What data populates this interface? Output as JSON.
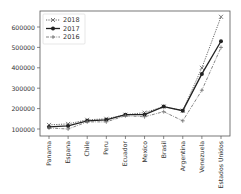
{
  "chart_data": {
    "type": "line",
    "title": "",
    "xlabel": "",
    "ylabel": "",
    "categories": [
      "Panama",
      "Espana",
      "Chile",
      "Peru",
      "Ecuador",
      "Mexico",
      "Brasil",
      "Argentina",
      "Venezuela",
      "Estados Unidos"
    ],
    "series": [
      {
        "name": "2018",
        "style": "dotted",
        "marker": "x",
        "values": [
          120000,
          125000,
          145000,
          150000,
          170000,
          180000,
          210000,
          190000,
          400000,
          650000
        ]
      },
      {
        "name": "2017",
        "style": "solid",
        "marker": "o",
        "values": [
          110000,
          115000,
          140000,
          145000,
          170000,
          170000,
          210000,
          190000,
          370000,
          530000
        ]
      },
      {
        "name": "2016",
        "style": "dashdot",
        "marker": "+",
        "values": [
          105000,
          100000,
          135000,
          135000,
          165000,
          160000,
          185000,
          140000,
          290000,
          500000
        ]
      }
    ],
    "yticks": [
      100000,
      200000,
      300000,
      400000,
      500000,
      600000
    ],
    "ytick_labels": [
      "100000",
      "200000",
      "300000",
      "400000",
      "500000",
      "600000"
    ],
    "ylim": [
      75000,
      700000
    ],
    "grid": false,
    "legend_position": "upper left"
  }
}
